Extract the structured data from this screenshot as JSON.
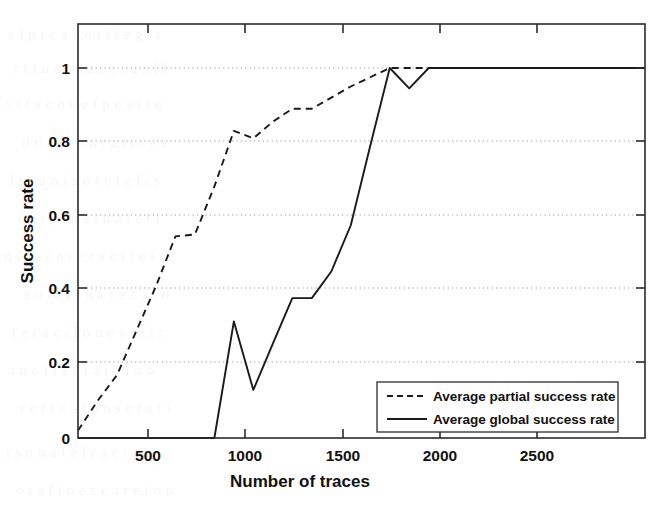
{
  "chart_data": {
    "type": "line",
    "title": "",
    "xlabel": "Number of traces",
    "ylabel": "Success rate",
    "xlim": [
      0,
      2910
    ],
    "ylim": [
      -0.06,
      1.15
    ],
    "grid": true,
    "grid_style": "dotted-horizontal",
    "legend_position": "lower right",
    "xticks": [
      500,
      1000,
      1500,
      2000,
      2500
    ],
    "xtick_labels": [
      "500",
      "1000",
      "1500",
      "2000",
      "2500"
    ],
    "yticks": [
      0,
      0.2,
      0.4,
      0.6,
      0.8,
      1
    ],
    "ytick_labels": [
      "0",
      "0.2",
      "0.4",
      "0.6",
      "0.8",
      "1"
    ],
    "series": [
      {
        "name": "Average partial success rate",
        "style": "dashed",
        "color": "#1a1a1a",
        "x": [
          0,
          100,
          200,
          300,
          400,
          500,
          600,
          700,
          800,
          900,
          1000,
          1100,
          1200,
          1300,
          1400,
          1500,
          1600,
          1700,
          1800,
          1900,
          2000,
          2200,
          2400,
          2600,
          2800,
          2910
        ],
        "y": [
          0.02,
          0.1,
          0.17,
          0.29,
          0.41,
          0.545,
          0.55,
          0.68,
          0.83,
          0.81,
          0.855,
          0.89,
          0.89,
          0.92,
          0.95,
          0.975,
          1.0,
          1.0,
          1.0,
          1.0,
          1.0,
          1.0,
          1.0,
          1.0,
          1.0,
          1.0
        ]
      },
      {
        "name": "Average global success rate",
        "style": "solid",
        "color": "#1a1a1a",
        "x": [
          0,
          100,
          200,
          300,
          400,
          500,
          600,
          700,
          800,
          900,
          1000,
          1100,
          1200,
          1300,
          1400,
          1500,
          1600,
          1700,
          1800,
          1900,
          2000,
          2200,
          2400,
          2600,
          2800,
          2910
        ],
        "y": [
          0.0,
          0.0,
          0.0,
          0.0,
          0.0,
          0.0,
          0.0,
          0.0,
          0.315,
          0.13,
          0.255,
          0.378,
          0.378,
          0.45,
          0.575,
          0.79,
          1.0,
          0.945,
          1.0,
          1.0,
          1.0,
          1.0,
          1.0,
          1.0,
          1.0,
          1.0
        ]
      }
    ]
  },
  "legend": {
    "entries": [
      {
        "label": "Average partial success rate",
        "style": "dashed"
      },
      {
        "label": "Average global success rate",
        "style": "solid"
      }
    ]
  },
  "axes": {
    "x_title": "Number of traces",
    "y_title": "Success rate",
    "x_tick_labels": [
      "500",
      "1000",
      "1500",
      "2000",
      "2500"
    ],
    "y_tick_labels": [
      "1",
      "0.8",
      "0.6",
      "0.4",
      "0.2",
      "0"
    ]
  }
}
